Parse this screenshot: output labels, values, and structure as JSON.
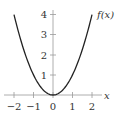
{
  "chart_data": {
    "type": "line",
    "title": "",
    "xlabel": "x",
    "ylabel": "f(x)",
    "function": "x^2",
    "x": [
      -2,
      -1.5,
      -1,
      -0.5,
      0,
      0.5,
      1,
      1.5,
      2
    ],
    "series": [
      {
        "name": "f(x)",
        "values": [
          4,
          2.25,
          1,
          0.25,
          0,
          0.25,
          1,
          2.25,
          4
        ]
      }
    ],
    "xlim": [
      -2,
      2
    ],
    "ylim": [
      0,
      4
    ],
    "xticks": [
      "−2",
      "−1",
      "0",
      "1",
      "2"
    ],
    "yticks": [
      "1",
      "2",
      "3",
      "4"
    ],
    "grid": false,
    "legend": "none",
    "colors": {
      "curve": "#222222",
      "axis": "#888888",
      "text": "#333333"
    }
  }
}
